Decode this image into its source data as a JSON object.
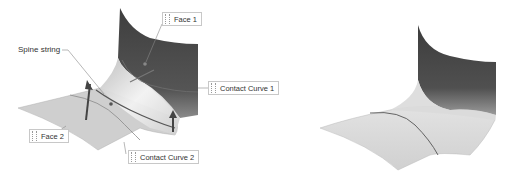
{
  "figure": {
    "left_view": {
      "title": "Blend setup with callouts",
      "labels": {
        "spine_string": "Spine string",
        "face_1": "Face 1",
        "face_2": "Face 2",
        "contact_curve_1": "Contact Curve 1",
        "contact_curve_2": "Contact Curve 2"
      }
    },
    "right_view": {
      "title": "Resulting blended surface"
    },
    "colors": {
      "background": "#ffffff",
      "face_dark": "#4a4a4a",
      "face_light": "#d8d8d8",
      "blend_highlight": "#ececec",
      "curve": "#5a5a5a",
      "leader": "#888888",
      "callout_border": "#c8c8c8",
      "text": "#333333"
    }
  }
}
